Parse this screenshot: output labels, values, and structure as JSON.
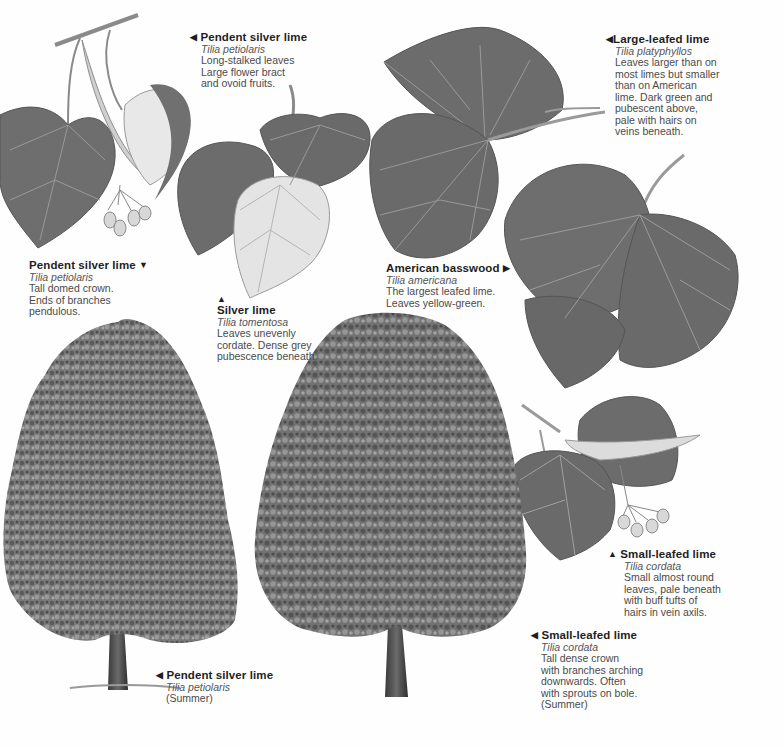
{
  "page": {
    "background": "#fefefe",
    "leaf_color_dark": "#6a6a6a",
    "leaf_color_light": "#d8d8d8",
    "text_color": "#3a3a3a"
  },
  "captions": [
    {
      "id": "pendent-silver-lime-leaf",
      "arrow": "left",
      "arrow_glyph": "◀",
      "common": "Pendent silver lime",
      "latin": "Tilia petiolaris",
      "desc": [
        "Long-stalked leaves",
        "Large flower bract",
        "and ovoid fruits."
      ]
    },
    {
      "id": "large-leafed-lime",
      "arrow": "left",
      "arrow_glyph": "◀",
      "common": "Large-leafed lime",
      "latin": "Tilia platyphyllos",
      "desc": [
        "Leaves larger than on",
        "most limes but smaller",
        "than on American",
        "lime. Dark green and",
        "pubescent above,",
        "pale with hairs on",
        "veins beneath."
      ]
    },
    {
      "id": "pendent-silver-lime-crown",
      "arrow": "down",
      "arrow_glyph": "▼",
      "common": "Pendent silver lime",
      "latin": "Tilia petiolaris",
      "desc": [
        "Tall domed crown.",
        "Ends of branches",
        "pendulous."
      ]
    },
    {
      "id": "silver-lime",
      "arrow": "up",
      "arrow_glyph": "▲",
      "common": "Silver lime",
      "latin": "Tilia tomentosa",
      "desc": [
        "Leaves unevenly",
        "cordate. Dense grey",
        "pubescence beneath."
      ]
    },
    {
      "id": "american-basswood",
      "arrow": "right",
      "arrow_glyph": "▶",
      "common": "American basswood",
      "latin": "Tilia americana",
      "desc": [
        "The largest leafed lime.",
        "Leaves yellow-green."
      ]
    },
    {
      "id": "small-leafed-lime-leaf",
      "arrow": "up",
      "arrow_glyph": "▲",
      "common": "Small-leafed lime",
      "latin": "Tilia cordata",
      "desc": [
        "Small almost round",
        "leaves, pale beneath",
        "with buff tufts of",
        "hairs in vein axils."
      ]
    },
    {
      "id": "small-leafed-lime-tree",
      "arrow": "left",
      "arrow_glyph": "◀",
      "common": "Small-leafed lime",
      "latin": "Tilia cordata",
      "desc": [
        "Tall dense crown",
        "with branches arching",
        "downwards. Often",
        "with sprouts on bole.",
        "(Summer)"
      ]
    },
    {
      "id": "pendent-silver-lime-tree",
      "arrow": "left",
      "arrow_glyph": "◀",
      "common": "Pendent silver lime",
      "latin": "Tilia petiolaris",
      "desc": [
        "(Summer)"
      ]
    }
  ],
  "illustrations": [
    {
      "id": "pendent-silver-lime-leaves",
      "label": "Pendent silver lime leaves with bract and fruits"
    },
    {
      "id": "silver-lime-leaves",
      "label": "Silver lime leaves"
    },
    {
      "id": "american-basswood-leaves",
      "label": "American basswood leaves"
    },
    {
      "id": "large-leafed-lime-leaves",
      "label": "Large-leafed lime leaves"
    },
    {
      "id": "small-leafed-lime-leaves",
      "label": "Small-leafed lime leaves with bract and fruits"
    },
    {
      "id": "pendent-silver-lime-tree",
      "label": "Pendent silver lime tree (Summer)"
    },
    {
      "id": "small-leafed-lime-tree",
      "label": "Small-leafed lime tree (Summer)"
    }
  ]
}
